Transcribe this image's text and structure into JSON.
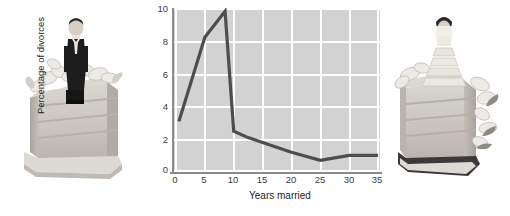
{
  "figure": {
    "left_photo": {
      "name": "groom-figurine-on-wedding-cake",
      "alt": "Groom cake topper figurine standing on a slice of wedding cake with white icing and sugar flowers"
    },
    "right_photo": {
      "name": "bride-figurine-on-wedding-cake",
      "alt": "Bride cake topper figurine standing on a slice of wedding cake with white icing and sugar flowers"
    }
  },
  "chart_data": {
    "type": "line",
    "title": "",
    "xlabel": "Years married",
    "ylabel": "Percentage of divorces",
    "xlim": [
      0,
      35
    ],
    "ylim": [
      0,
      10
    ],
    "xticks": [
      0,
      5,
      10,
      15,
      20,
      25,
      30,
      35
    ],
    "yticks": [
      0,
      2,
      4,
      6,
      8,
      10
    ],
    "xtick_labels": [
      "0",
      "5",
      "10",
      "15",
      "20",
      "25",
      "30",
      "35"
    ],
    "ytick_labels": [
      "0",
      "2",
      "4",
      "6",
      "8",
      "10"
    ],
    "grid": true,
    "grid_color": "#ffffff",
    "plot_background": "#d2d2d2",
    "legend": null,
    "series": [
      {
        "name": "Percentage of divorces",
        "color": "#4d4d4d",
        "x": [
          0.5,
          5,
          8.5,
          10,
          12.5,
          15,
          20,
          25,
          30,
          35
        ],
        "y": [
          3.0,
          8.2,
          9.8,
          2.4,
          2.0,
          1.7,
          1.1,
          0.6,
          0.9,
          0.9
        ]
      }
    ]
  }
}
